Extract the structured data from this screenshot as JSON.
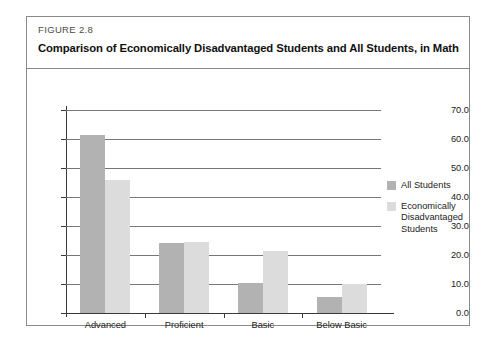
{
  "figure": {
    "number_label": "FIGURE 2.8",
    "title": "Comparison of Economically Disadvantaged Students and All Students, in Math"
  },
  "chart_data": {
    "type": "bar",
    "title": "Comparison of Economically Disadvantaged Students and All Students, in Math",
    "categories": [
      "Advanced",
      "Proficient",
      "Basic",
      "Below Basic"
    ],
    "series": [
      {
        "name": "All Students",
        "color": "#b2b2b2",
        "values": [
          61.5,
          24.0,
          10.3,
          5.5
        ]
      },
      {
        "name": "Economically Disadvantaged Students",
        "color": "#dcdcdc",
        "values": [
          46.0,
          24.5,
          21.5,
          10.0
        ]
      }
    ],
    "xlabel": "",
    "ylabel": "",
    "ylim": [
      0.0,
      70.0
    ],
    "ytick_labels": [
      "70.0",
      "60.0",
      "50.0",
      "40.0",
      "30.0",
      "20.0",
      "10.0",
      "0.0"
    ],
    "ytick_values": [
      70.0,
      60.0,
      50.0,
      40.0,
      30.0,
      20.0,
      10.0,
      0.0
    ],
    "grid": true,
    "legend_position": "right"
  }
}
